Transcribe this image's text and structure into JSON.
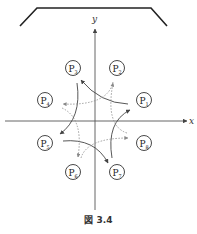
{
  "figure": {
    "caption": "図 3.4",
    "axes": {
      "x_label": "x",
      "y_label": "y"
    },
    "points": [
      {
        "id": "P1",
        "base": "P",
        "sub": "1",
        "cx": 144,
        "cy": 100
      },
      {
        "id": "P2",
        "base": "P",
        "sub": "2",
        "cx": 117,
        "cy": 68
      },
      {
        "id": "P3",
        "base": "P",
        "sub": "3",
        "cx": 73,
        "cy": 68
      },
      {
        "id": "P4",
        "base": "P",
        "sub": "4",
        "cx": 45,
        "cy": 100
      },
      {
        "id": "P5",
        "base": "P",
        "sub": "5",
        "cx": 45,
        "cy": 143
      },
      {
        "id": "P6",
        "base": "P",
        "sub": "6",
        "cx": 73,
        "cy": 172
      },
      {
        "id": "P7",
        "base": "P",
        "sub": "7",
        "cx": 117,
        "cy": 172
      },
      {
        "id": "P8",
        "base": "P",
        "sub": "8",
        "cx": 144,
        "cy": 143
      }
    ],
    "solid_arrows": [
      "P1→P3",
      "P3→P5",
      "P5→P7",
      "P7→P1"
    ],
    "dotted_arrows": [
      "P2→P4",
      "P4→P6",
      "P6→P8",
      "P8→P2"
    ],
    "colors": {
      "line": "#333333",
      "axis": "#555555",
      "dotted": "#888888"
    }
  }
}
